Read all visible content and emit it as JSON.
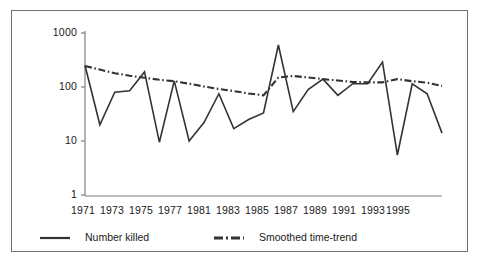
{
  "chart_data": {
    "type": "line",
    "title": "",
    "xlabel": "",
    "ylabel": "",
    "yscale": "log",
    "ylim": [
      1,
      1000
    ],
    "xlim": [
      1971,
      1995
    ],
    "grid": false,
    "legend_position": "bottom",
    "y_ticks": [
      "1000",
      "100",
      "10",
      "1"
    ],
    "y_tick_values": [
      1000,
      100,
      10,
      1
    ],
    "x_ticks": [
      "1971",
      "1973",
      "1975",
      "1977",
      "1981",
      "1983",
      "1985",
      "1987",
      "1989",
      "1991",
      "1993",
      "1995"
    ],
    "x_tick_values": [
      1971,
      1973,
      1975,
      1977,
      1979,
      1981,
      1983,
      1985,
      1987,
      1989,
      1991,
      1993
    ],
    "x": [
      1971,
      1972,
      1973,
      1974,
      1975,
      1976,
      1977,
      1978,
      1979,
      1980,
      1981,
      1982,
      1983,
      1984,
      1985,
      1986,
      1987,
      1988,
      1989,
      1990,
      1991,
      1992,
      1993,
      1994,
      1995
    ],
    "series": [
      {
        "name": "Number killed",
        "style": "solid",
        "color": "#333333",
        "values": [
          250,
          20,
          80,
          85,
          190,
          9.5,
          130,
          10,
          22,
          75,
          17,
          25,
          33,
          600,
          35,
          90,
          140,
          70,
          115,
          115,
          290,
          5.5,
          115,
          75,
          14
        ]
      },
      {
        "name": "Smoothed time-trend",
        "style": "dash-dot",
        "color": "#333333",
        "values": [
          245,
          210,
          180,
          162,
          148,
          136,
          128,
          115,
          102,
          92,
          84,
          76,
          70,
          150,
          160,
          150,
          140,
          132,
          124,
          122,
          122,
          140,
          128,
          120,
          105
        ]
      }
    ]
  },
  "legend": {
    "items": [
      {
        "label": "Number killed",
        "style": "solid"
      },
      {
        "label": "Smoothed time-trend",
        "style": "dash-dot"
      }
    ]
  },
  "colors": {
    "line": "#333333",
    "axis": "#808080",
    "frame": "#6f6f6f",
    "text": "#1a1a1a",
    "background": "#ffffff"
  }
}
